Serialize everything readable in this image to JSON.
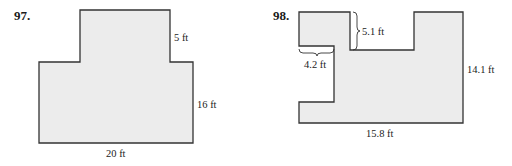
{
  "figures": [
    {
      "number": "97.",
      "labels": {
        "top_side": "5 ft",
        "right_side": "16 ft",
        "bottom_side": "20 ft"
      }
    },
    {
      "number": "98.",
      "labels": {
        "notch_depth": "5.1 ft",
        "left_step": "4.2 ft",
        "right_side": "14.1 ft",
        "bottom_side": "15.8 ft"
      }
    }
  ],
  "colors": {
    "fill": "#ececec",
    "stroke": "#333333"
  }
}
